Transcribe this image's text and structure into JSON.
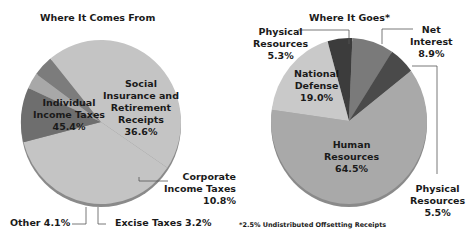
{
  "chart_data": [
    {
      "type": "pie",
      "title": "Where It Comes From",
      "categories": [
        "Social Insurance and Retirement Receipts",
        "Corporate Income Taxes",
        "Excise Taxes",
        "Other",
        "Individual Income Taxes"
      ],
      "values": [
        36.6,
        10.8,
        3.2,
        4.1,
        45.4
      ],
      "unit": "%",
      "colors": [
        "#c4c4c4",
        "#6e6e6e",
        "#a8a8a8",
        "#7c7c7c",
        "#c4c4c4"
      ]
    },
    {
      "type": "pie",
      "title": "Where It Goes*",
      "categories": [
        "Physical Resources",
        "Net Interest",
        "Physical Resources",
        "Human Resources",
        "National Defense"
      ],
      "values": [
        5.3,
        8.9,
        5.5,
        64.5,
        19.0
      ],
      "unit": "%",
      "colors": [
        "#3c3c3c",
        "#7a7a7a",
        "#4a4a4a",
        "#a9a9a9",
        "#c9c9c9"
      ],
      "footnote": "*2.5% Undistributed Offsetting Receipts"
    }
  ],
  "left": {
    "title": "Where It Comes From",
    "individual": {
      "l1": "Individual",
      "l2": "Income Taxes",
      "pct": "45.4%"
    },
    "social": {
      "l1": "Social",
      "l2": "Insurance and",
      "l3": "Retirement",
      "l4": "Receipts",
      "pct": "36.6%"
    },
    "corporate": {
      "l1": "Corporate",
      "l2": "Income Taxes",
      "pct": "10.8%"
    },
    "other": "Other 4.1%",
    "excise": "Excise Taxes 3.2%"
  },
  "right": {
    "title": "Where It Goes*",
    "phys_top": {
      "l1": "Physical",
      "l2": "Resources",
      "pct": "5.3%"
    },
    "net": {
      "l1": "Net",
      "l2": "Interest",
      "pct": "8.9%"
    },
    "defense": {
      "l1": "National",
      "l2": "Defense",
      "pct": "19.0%"
    },
    "human": {
      "l1": "Human",
      "l2": "Resources",
      "pct": "64.5%"
    },
    "phys_bot": {
      "l1": "Physical",
      "l2": "Resources",
      "pct": "5.5%"
    },
    "footnote": "*2.5% Undistributed Offsetting Receipts"
  }
}
